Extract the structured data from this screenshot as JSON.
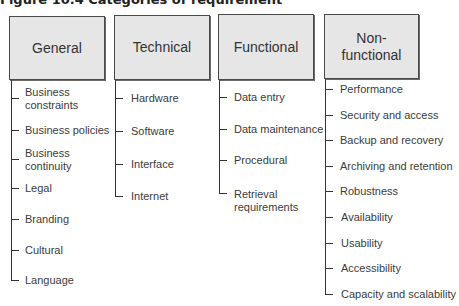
{
  "figure": {
    "title": "Figure 10.4 Categories of requirement"
  },
  "colors": {
    "box_fill": "#e6e6e6",
    "box_border": "#4a4a4a",
    "line": "#333333",
    "text": "#3c3c3c"
  },
  "categories": [
    {
      "label": "General",
      "items": [
        "Business constraints",
        "Business policies",
        "Business continuity",
        "Legal",
        "Branding",
        "Cultural",
        "Language"
      ]
    },
    {
      "label": "Technical",
      "items": [
        "Hardware",
        "Software",
        "Interface",
        "Internet"
      ]
    },
    {
      "label": "Functional",
      "items": [
        "Data entry",
        "Data maintenance",
        "Procedural",
        "Retrieval requirements"
      ]
    },
    {
      "label": "Non-functional",
      "items": [
        "Performance",
        "Security and access",
        "Backup and recovery",
        "Archiving and retention",
        "Robustness",
        "Availability",
        "Usability",
        "Accessibility",
        "Capacity and scalability"
      ]
    }
  ]
}
